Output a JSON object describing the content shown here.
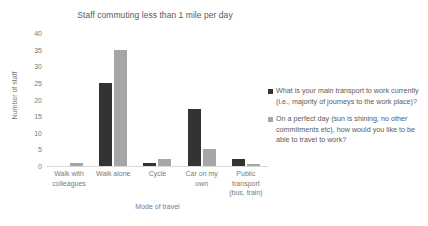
{
  "chart_data": {
    "type": "bar",
    "title": "Staff commuting less than 1 mile per day",
    "xlabel": "Mode of travel",
    "ylabel": "Number of staff",
    "ylim": [
      0,
      40
    ],
    "yticks": [
      40,
      35,
      30,
      25,
      20,
      15,
      10,
      5,
      0
    ],
    "ytick_labels": [
      "40",
      "35",
      "30",
      "25",
      "20",
      "15",
      "10",
      "5",
      "0"
    ],
    "grid": false,
    "legend_position": "right",
    "categories": [
      "Walk with colleagues",
      "Walk alone",
      "Cycle",
      "Car on my own",
      "Public transport (bus, train)"
    ],
    "category_lines": [
      [
        "Walk with",
        "colleagues"
      ],
      [
        "Walk alone"
      ],
      [
        "Cycle"
      ],
      [
        "Car on my",
        "own"
      ],
      [
        "Public",
        "transport",
        "(bus, train)"
      ]
    ],
    "series": [
      {
        "name": "What is your main transport to work currently (i.e., majority of journeys to the work place)?",
        "color": "#333333",
        "values": [
          0,
          25,
          1,
          17,
          2
        ]
      },
      {
        "name": "On a perfect day (sun is shining, no other commitments etc), how would you like to be able to travel to work?",
        "color": "#a6a6a6",
        "values": [
          1,
          35,
          2,
          5,
          0.5
        ]
      }
    ]
  },
  "legend": {
    "entries": [
      "What is your main transport to work currently (i.e., majority of journeys to the work place)?",
      "On a perfect day (sun is shining, no other commitments etc), how would you like to be able to travel to work?"
    ]
  },
  "colors": {
    "series_current": "#333333",
    "series_perfect_day": "#a6a6a6",
    "axis": "#d9d9d9",
    "text": "#7a7a7a",
    "title": "#595959",
    "background": "#ffffff"
  }
}
